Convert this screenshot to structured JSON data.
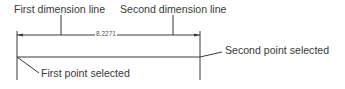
{
  "labels": {
    "first_dimension_line": "First dimension line",
    "second_dimension_line": "Second dimension line",
    "second_point_selected": "Second point selected",
    "first_point_selected": "First point selected"
  },
  "dimension": {
    "value": "8.2271"
  },
  "colors": {
    "line": "#3a3a3a",
    "text": "#3a3a3a"
  }
}
